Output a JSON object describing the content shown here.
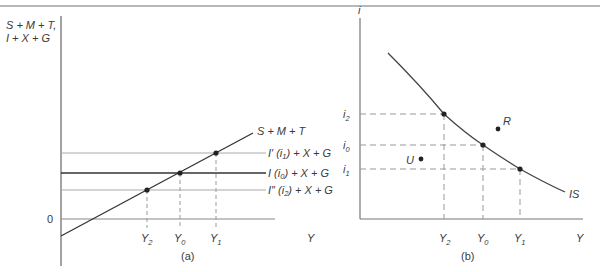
{
  "figure": {
    "panel_a": {
      "caption": "(a)",
      "y_axis_label_line1": "S + M + T,",
      "y_axis_label_line2": "I + X + G",
      "x_axis_label": "Y",
      "origin_label": "0",
      "saving_line_label": "S + M + T",
      "lines": [
        {
          "id": "I_prime",
          "label_pre": "I′ (i",
          "label_sub": "1",
          "label_post": ") + X + G",
          "style": "light"
        },
        {
          "id": "I",
          "label_pre": "I (i",
          "label_sub": "0",
          "label_post": ") + X + G",
          "style": "dark"
        },
        {
          "id": "I_double_prime",
          "label_pre": "I″ (i",
          "label_sub": "2",
          "label_post": ") + X + G",
          "style": "light"
        }
      ],
      "x_ticks": [
        {
          "base": "Y",
          "sub": "2"
        },
        {
          "base": "Y",
          "sub": "0"
        },
        {
          "base": "Y",
          "sub": "1"
        }
      ]
    },
    "panel_b": {
      "caption": "(b)",
      "y_axis_label": "i",
      "x_axis_label": "Y",
      "curve_label": "IS",
      "y_ticks": [
        {
          "base": "i",
          "sub": "2"
        },
        {
          "base": "i",
          "sub": "0"
        },
        {
          "base": "i",
          "sub": "1"
        }
      ],
      "x_ticks": [
        {
          "base": "Y",
          "sub": "2"
        },
        {
          "base": "Y",
          "sub": "0"
        },
        {
          "base": "Y",
          "sub": "1"
        }
      ],
      "points": [
        {
          "label": "R"
        },
        {
          "label": "U"
        }
      ]
    }
  }
}
